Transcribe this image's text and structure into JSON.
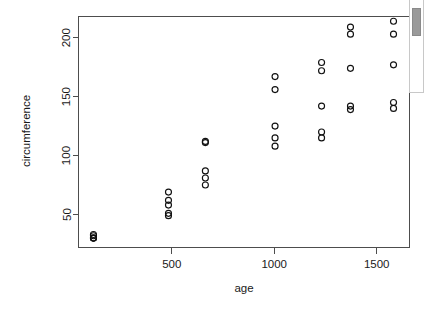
{
  "chart_data": {
    "type": "scatter",
    "title": "",
    "xlabel": "age",
    "ylabel": "circumference",
    "xlim": [
      45,
      1660
    ],
    "ylim": [
      22,
      218
    ],
    "xticks": [
      500,
      1000,
      1500
    ],
    "yticks": [
      50,
      100,
      150,
      200
    ],
    "xtick_labels": [
      "500",
      "1000",
      "1500"
    ],
    "ytick_labels": [
      "50",
      "100",
      "150",
      "200"
    ],
    "grid": false,
    "legend": false,
    "marker": "open-circle",
    "marker_color": "#111111",
    "frame": "box",
    "x": [
      118,
      484,
      664,
      1004,
      1231,
      1372,
      1582,
      118,
      484,
      664,
      1004,
      1231,
      1372,
      1582,
      118,
      484,
      664,
      1004,
      1231,
      1372,
      1582,
      118,
      484,
      664,
      1004,
      1231,
      1372,
      1582,
      118,
      484,
      664,
      1004,
      1231,
      1372,
      1582
    ],
    "y": [
      30,
      58,
      87,
      115,
      120,
      142,
      145,
      33,
      69,
      111,
      156,
      172,
      203,
      203,
      30,
      51,
      75,
      108,
      115,
      139,
      140,
      32,
      62,
      112,
      167,
      179,
      209,
      214,
      30,
      49,
      81,
      125,
      142,
      174,
      177
    ],
    "series": [
      {
        "name": "Tree 1",
        "points": [
          {
            "age": 118,
            "circumference": 30
          },
          {
            "age": 484,
            "circumference": 58
          },
          {
            "age": 664,
            "circumference": 87
          },
          {
            "age": 1004,
            "circumference": 115
          },
          {
            "age": 1231,
            "circumference": 120
          },
          {
            "age": 1372,
            "circumference": 142
          },
          {
            "age": 1582,
            "circumference": 145
          }
        ]
      },
      {
        "name": "Tree 2",
        "points": [
          {
            "age": 118,
            "circumference": 33
          },
          {
            "age": 484,
            "circumference": 69
          },
          {
            "age": 664,
            "circumference": 111
          },
          {
            "age": 1004,
            "circumference": 156
          },
          {
            "age": 1231,
            "circumference": 172
          },
          {
            "age": 1372,
            "circumference": 203
          },
          {
            "age": 1582,
            "circumference": 203
          }
        ]
      },
      {
        "name": "Tree 3",
        "points": [
          {
            "age": 118,
            "circumference": 30
          },
          {
            "age": 484,
            "circumference": 51
          },
          {
            "age": 664,
            "circumference": 75
          },
          {
            "age": 1004,
            "circumference": 108
          },
          {
            "age": 1231,
            "circumference": 115
          },
          {
            "age": 1372,
            "circumference": 139
          },
          {
            "age": 1582,
            "circumference": 140
          }
        ]
      },
      {
        "name": "Tree 4",
        "points": [
          {
            "age": 118,
            "circumference": 32
          },
          {
            "age": 484,
            "circumference": 62
          },
          {
            "age": 664,
            "circumference": 112
          },
          {
            "age": 1004,
            "circumference": 167
          },
          {
            "age": 1231,
            "circumference": 179
          },
          {
            "age": 1372,
            "circumference": 209
          },
          {
            "age": 1582,
            "circumference": 214
          }
        ]
      },
      {
        "name": "Tree 5",
        "points": [
          {
            "age": 118,
            "circumference": 30
          },
          {
            "age": 484,
            "circumference": 49
          },
          {
            "age": 664,
            "circumference": 81
          },
          {
            "age": 1004,
            "circumference": 125
          },
          {
            "age": 1231,
            "circumference": 142
          },
          {
            "age": 1372,
            "circumference": 174
          },
          {
            "age": 1582,
            "circumference": 177
          }
        ]
      }
    ]
  },
  "scrollbar": {
    "orientation": "vertical",
    "thumb_position": "top"
  }
}
